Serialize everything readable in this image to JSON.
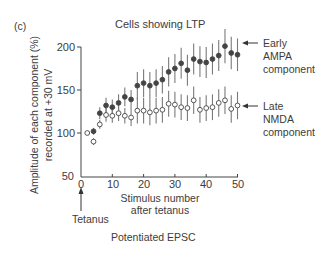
{
  "figure": {
    "panel_label": "(c)",
    "title": "Cells showing LTP",
    "ylabel_line1": "Amplitude of each component (%)",
    "ylabel_line2": "recorded at +30 mV",
    "xlabel_line1": "Stimulus number",
    "xlabel_line2": "after tetanus",
    "tetanus_label": "Tetanus",
    "caption": "Potentiated EPSC",
    "early_label": [
      "Early",
      "AMPA",
      "component"
    ],
    "late_label": [
      "Late",
      "NMDA",
      "component"
    ],
    "yticks": [
      "200",
      "150",
      "100",
      "50"
    ],
    "xticks": [
      "0",
      "10",
      "20",
      "30",
      "40",
      "50"
    ]
  },
  "chart_data": {
    "type": "scatter",
    "title": "Cells showing LTP",
    "xlabel": "Stimulus number after tetanus",
    "ylabel": "Amplitude of each component (%) recorded at +30 mV",
    "xlim": [
      0,
      50
    ],
    "ylim": [
      50,
      200
    ],
    "xticks": [
      0,
      10,
      20,
      30,
      40,
      50
    ],
    "yticks": [
      50,
      100,
      150,
      200
    ],
    "grid": false,
    "annotations": [
      "Tetanus (arrow at stimulus 0)",
      "Potentiated EPSC",
      "(c)"
    ],
    "baseline_point": {
      "x": 2,
      "y": 100,
      "marker": "open"
    },
    "series": [
      {
        "name": "Early AMPA component",
        "marker": "filled circle",
        "x": [
          4,
          6,
          8,
          10,
          12,
          14,
          16,
          18,
          20,
          22,
          24,
          26,
          28,
          30,
          32,
          34,
          36,
          38,
          40,
          42,
          44,
          46,
          48,
          50
        ],
        "y": [
          102,
          123,
          132,
          130,
          135,
          142,
          139,
          155,
          158,
          155,
          158,
          162,
          171,
          175,
          181,
          173,
          186,
          183,
          182,
          186,
          190,
          201,
          193,
          191
        ],
        "error": [
          4,
          7,
          9,
          9,
          10,
          11,
          11,
          16,
          16,
          16,
          16,
          16,
          17,
          17,
          18,
          18,
          18,
          18,
          18,
          18,
          18,
          20,
          19,
          19
        ]
      },
      {
        "name": "Late NMDA component",
        "marker": "open circle",
        "x": [
          4,
          6,
          8,
          10,
          12,
          14,
          16,
          18,
          20,
          22,
          24,
          26,
          28,
          30,
          32,
          34,
          36,
          38,
          40,
          42,
          44,
          46,
          48,
          50
        ],
        "y": [
          90,
          110,
          121,
          120,
          123,
          120,
          118,
          126,
          126,
          124,
          126,
          127,
          134,
          133,
          130,
          129,
          138,
          127,
          129,
          130,
          135,
          138,
          128,
          132
        ],
        "error": [
          4,
          5,
          8,
          8,
          9,
          9,
          10,
          15,
          15,
          15,
          15,
          15,
          15,
          15,
          15,
          15,
          16,
          15,
          15,
          15,
          16,
          16,
          16,
          16
        ]
      }
    ],
    "colors": {
      "axis": "#444444",
      "marker": "#444444",
      "errorbar": "#7a7a7a"
    }
  }
}
